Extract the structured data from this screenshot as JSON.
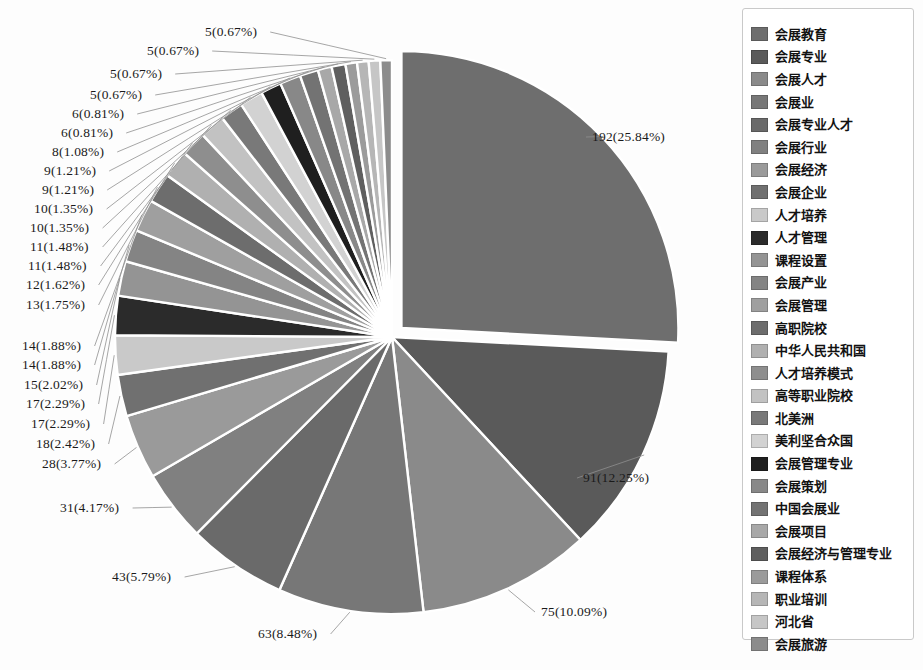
{
  "chart_data": {
    "type": "pie",
    "title": "",
    "total": 743,
    "start_angle_deg": 0,
    "direction": "clockwise",
    "exploded_slice_index": 0,
    "explode_offset_px": 13,
    "label_format": "count (percent%)",
    "legend_position": "right",
    "grid": false,
    "categories": [
      "会展教育",
      "会展专业",
      "会展人才",
      "会展业",
      "会展专业人才",
      "会展行业",
      "会展经济",
      "会展企业",
      "人才培养",
      "人才管理",
      "课程设置",
      "会展产业",
      "会展管理",
      "高职院校",
      "中华人民共和国",
      "人才培养模式",
      "高等职业院校",
      "北美洲",
      "美利坚合众国",
      "会展管理专业",
      "会展策划",
      "中国会展业",
      "会展项目",
      "会展经济与管理专业",
      "课程体系",
      "职业培训",
      "河北省",
      "会展旅游"
    ],
    "values": [
      192,
      91,
      75,
      63,
      43,
      31,
      28,
      18,
      17,
      17,
      15,
      14,
      14,
      13,
      12,
      11,
      11,
      10,
      10,
      9,
      9,
      8,
      6,
      6,
      5,
      5,
      5,
      5
    ],
    "percents": [
      "25.84",
      "12.25",
      "10.09",
      "8.48",
      "5.79",
      "4.17",
      "3.77",
      "2.42",
      "2.29",
      "2.29",
      "2.02",
      "1.88",
      "1.88",
      "1.75",
      "1.62",
      "1.48",
      "1.48",
      "1.35",
      "1.35",
      "1.21",
      "1.21",
      "1.08",
      "0.81",
      "0.81",
      "0.67",
      "0.67",
      "0.67",
      "0.67"
    ],
    "colors": [
      "#6e6e6e",
      "#5a5a5a",
      "#8a8a8a",
      "#777777",
      "#6a6a6a",
      "#808080",
      "#9a9a9a",
      "#707070",
      "#c9c9c9",
      "#2b2b2b",
      "#949494",
      "#848484",
      "#9f9f9f",
      "#6d6d6d",
      "#b0b0b0",
      "#8e8e8e",
      "#c2c2c2",
      "#797979",
      "#d2d2d2",
      "#1f1f1f",
      "#888888",
      "#737373",
      "#a8a8a8",
      "#5f5f5f",
      "#9b9b9b",
      "#b6b6b6",
      "#c6c6c6",
      "#8c8c8c"
    ],
    "labels": [
      {
        "text": "192(25.84%)",
        "side": "right",
        "x": 592,
        "y": 137
      },
      {
        "text": "91(12.25%)",
        "side": "right",
        "x": 583,
        "y": 478
      },
      {
        "text": "75(10.09%)",
        "side": "right",
        "x": 541,
        "y": 612
      },
      {
        "text": "63(8.48%)",
        "side": "left",
        "x": 258,
        "y": 634
      },
      {
        "text": "43(5.79%)",
        "side": "left",
        "x": 112,
        "y": 577
      },
      {
        "text": "31(4.17%)",
        "side": "left",
        "x": 60,
        "y": 508
      },
      {
        "text": "28(3.77%)",
        "side": "left",
        "x": 42,
        "y": 464
      },
      {
        "text": "18(2.42%)",
        "side": "left",
        "x": 36,
        "y": 444
      },
      {
        "text": "17(2.29%)",
        "side": "left",
        "x": 31,
        "y": 424
      },
      {
        "text": "17(2.29%)",
        "side": "left",
        "x": 26,
        "y": 404
      },
      {
        "text": "15(2.02%)",
        "side": "left",
        "x": 24,
        "y": 385
      },
      {
        "text": "14(1.88%)",
        "side": "left",
        "x": 22,
        "y": 365
      },
      {
        "text": "14(1.88%)",
        "side": "left",
        "x": 22,
        "y": 346
      },
      {
        "text": "13(1.75%)",
        "side": "left",
        "x": 26,
        "y": 305
      },
      {
        "text": "12(1.62%)",
        "side": "left",
        "x": 26,
        "y": 285
      },
      {
        "text": "11(1.48%)",
        "side": "left",
        "x": 28,
        "y": 266
      },
      {
        "text": "11(1.48%)",
        "side": "left",
        "x": 30,
        "y": 247
      },
      {
        "text": "10(1.35%)",
        "side": "left",
        "x": 30,
        "y": 228
      },
      {
        "text": "10(1.35%)",
        "side": "left",
        "x": 34,
        "y": 209
      },
      {
        "text": "9(1.21%)",
        "side": "left",
        "x": 42,
        "y": 190
      },
      {
        "text": "9(1.21%)",
        "side": "left",
        "x": 44,
        "y": 171
      },
      {
        "text": "8(1.08%)",
        "side": "left",
        "x": 52,
        "y": 152
      },
      {
        "text": "6(0.81%)",
        "side": "left",
        "x": 61,
        "y": 133
      },
      {
        "text": "6(0.81%)",
        "side": "left",
        "x": 72,
        "y": 114
      },
      {
        "text": "5(0.67%)",
        "side": "left",
        "x": 90,
        "y": 95
      },
      {
        "text": "5(0.67%)",
        "side": "left",
        "x": 110,
        "y": 74
      },
      {
        "text": "5(0.67%)",
        "side": "left",
        "x": 147,
        "y": 51
      },
      {
        "text": "5(0.67%)",
        "side": "left",
        "x": 205,
        "y": 32
      }
    ]
  },
  "legend": {
    "items": [
      {
        "label": "会展教育",
        "color": "#6e6e6e"
      },
      {
        "label": "会展专业",
        "color": "#5a5a5a"
      },
      {
        "label": "会展人才",
        "color": "#8a8a8a"
      },
      {
        "label": "会展业",
        "color": "#777777"
      },
      {
        "label": "会展专业人才",
        "color": "#6a6a6a"
      },
      {
        "label": "会展行业",
        "color": "#808080"
      },
      {
        "label": "会展经济",
        "color": "#9a9a9a"
      },
      {
        "label": "会展企业",
        "color": "#707070"
      },
      {
        "label": "人才培养",
        "color": "#c9c9c9"
      },
      {
        "label": "人才管理",
        "color": "#2b2b2b"
      },
      {
        "label": "课程设置",
        "color": "#949494"
      },
      {
        "label": "会展产业",
        "color": "#848484"
      },
      {
        "label": "会展管理",
        "color": "#9f9f9f"
      },
      {
        "label": "高职院校",
        "color": "#6d6d6d"
      },
      {
        "label": "中华人民共和国",
        "color": "#b0b0b0"
      },
      {
        "label": "人才培养模式",
        "color": "#8e8e8e"
      },
      {
        "label": "高等职业院校",
        "color": "#c2c2c2"
      },
      {
        "label": "北美洲",
        "color": "#797979"
      },
      {
        "label": "美利坚合众国",
        "color": "#d2d2d2"
      },
      {
        "label": "会展管理专业",
        "color": "#1f1f1f"
      },
      {
        "label": "会展策划",
        "color": "#888888"
      },
      {
        "label": "中国会展业",
        "color": "#737373"
      },
      {
        "label": "会展项目",
        "color": "#a8a8a8"
      },
      {
        "label": "会展经济与管理专业",
        "color": "#5f5f5f"
      },
      {
        "label": "课程体系",
        "color": "#9b9b9b"
      },
      {
        "label": "职业培训",
        "color": "#b6b6b6"
      },
      {
        "label": "河北省",
        "color": "#c6c6c6"
      },
      {
        "label": "会展旅游",
        "color": "#8c8c8c"
      }
    ]
  }
}
